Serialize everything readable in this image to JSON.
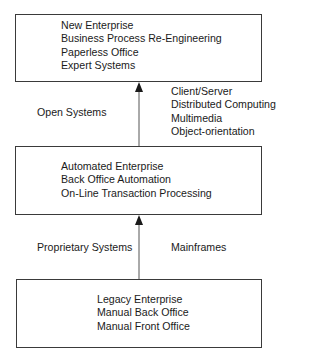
{
  "diagram": {
    "type": "flowchart",
    "direction": "bottom-to-top",
    "stages": [
      {
        "id": "new-enterprise",
        "lines": [
          "New Enterprise",
          "Business Process Re-Engineering",
          "Paperless Office",
          "Expert Systems"
        ]
      },
      {
        "id": "automated-enterprise",
        "lines": [
          "Automated Enterprise",
          "Back Office Automation",
          "On-Line Transaction Processing"
        ]
      },
      {
        "id": "legacy-enterprise",
        "lines": [
          "Legacy Enterprise",
          "Manual Back Office",
          "Manual Front Office"
        ]
      }
    ],
    "transitions": [
      {
        "from": "automated-enterprise",
        "to": "new-enterprise",
        "left_label": "Open Systems",
        "right_labels": [
          "Client/Server",
          "Distributed Computing",
          "Multimedia",
          "Object-orientation"
        ]
      },
      {
        "from": "legacy-enterprise",
        "to": "automated-enterprise",
        "left_label": "Proprietary Systems",
        "right_labels": [
          "Mainframes"
        ]
      }
    ]
  },
  "colors": {
    "line": "#3a3a3a",
    "text": "#1a1a1a",
    "background": "#ffffff"
  }
}
